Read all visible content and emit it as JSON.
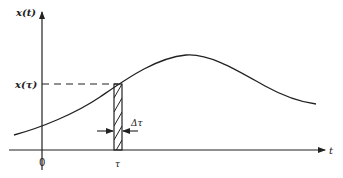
{
  "diagram": {
    "type": "signal-sampling-illustration",
    "y_axis_label": "x(t)",
    "x_axis_label": "t",
    "origin_label": "0",
    "sample_value_label": "x(τ)",
    "sample_position_label": "τ",
    "strip_width_label": "Δτ",
    "colors": {
      "line": "#222222",
      "background": "#ffffff"
    },
    "curve_points": [
      [
        14,
        135
      ],
      [
        42,
        126
      ],
      [
        70,
        115
      ],
      [
        100,
        97
      ],
      [
        122,
        83
      ],
      [
        150,
        66
      ],
      [
        170,
        57
      ],
      [
        186,
        55
      ],
      [
        205,
        58
      ],
      [
        230,
        70
      ],
      [
        260,
        84
      ],
      [
        290,
        97
      ],
      [
        316,
        104
      ]
    ]
  }
}
